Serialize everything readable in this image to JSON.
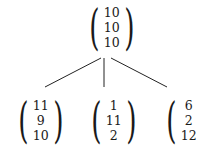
{
  "tree": {
    "root": {
      "values": [
        "10",
        "10",
        "10"
      ]
    },
    "children": [
      {
        "values": [
          "11",
          "9",
          "10"
        ]
      },
      {
        "values": [
          "1",
          "11",
          "2"
        ]
      },
      {
        "values": [
          "6",
          "2",
          "12"
        ]
      }
    ]
  },
  "colors": {
    "ink": "#1a1a1a",
    "background": "#ffffff"
  }
}
